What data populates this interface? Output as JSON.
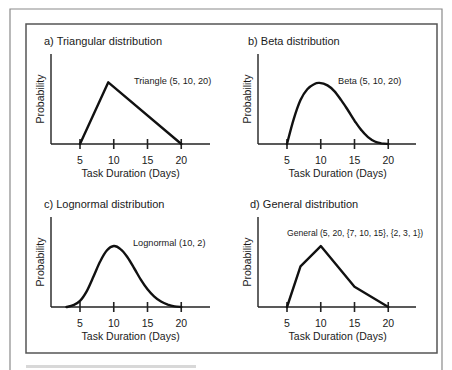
{
  "figure": {
    "caption": ""
  },
  "chart_data": [
    {
      "type": "line",
      "title": "a) Triangular distribution",
      "annotation": "Triangle (5, 10, 20)",
      "xlabel": "Task Duration (Days)",
      "ylabel": "Probability",
      "xticks": [
        5,
        10,
        15,
        20
      ],
      "xlim": [
        0,
        24
      ],
      "ylim": [
        0,
        1
      ],
      "grid": false,
      "series": [
        {
          "name": "Triangle (5, 10, 20)",
          "x": [
            5,
            9.2,
            20
          ],
          "y": [
            0,
            0.95,
            0
          ]
        }
      ]
    },
    {
      "type": "line",
      "title": "b) Beta distribution",
      "annotation": "Beta (5, 10, 20)",
      "xlabel": "Task Duration (Days)",
      "ylabel": "Probability",
      "xticks": [
        5,
        10,
        15,
        20
      ],
      "xlim": [
        0,
        24
      ],
      "ylim": [
        0,
        1
      ],
      "grid": false,
      "series": [
        {
          "name": "Beta (5, 10, 20)",
          "x": [
            5,
            6,
            7,
            8,
            9,
            9.8,
            11,
            12,
            13,
            14,
            15,
            16,
            17,
            18,
            19,
            20
          ],
          "y": [
            0,
            0.4,
            0.7,
            0.87,
            0.95,
            0.97,
            0.93,
            0.84,
            0.7,
            0.54,
            0.37,
            0.22,
            0.11,
            0.04,
            0.01,
            0
          ]
        }
      ]
    },
    {
      "type": "line",
      "title": "c) Lognormal distribution",
      "annotation": "Lognormal (10, 2)",
      "xlabel": "Task Duration (Days)",
      "ylabel": "Probability",
      "xticks": [
        5,
        10,
        15,
        20
      ],
      "xlim": [
        0,
        24
      ],
      "ylim": [
        0,
        1
      ],
      "grid": false,
      "series": [
        {
          "name": "Lognormal (10, 2)",
          "x": [
            3,
            4,
            5,
            6,
            7,
            8,
            9,
            10,
            11,
            12,
            13,
            14,
            15,
            16,
            17,
            18,
            19,
            20
          ],
          "y": [
            0,
            0.03,
            0.1,
            0.26,
            0.5,
            0.75,
            0.93,
            1.0,
            0.95,
            0.82,
            0.64,
            0.45,
            0.29,
            0.17,
            0.09,
            0.04,
            0.01,
            0
          ]
        }
      ]
    },
    {
      "type": "line",
      "title": "d) General distribution",
      "annotation": "General (5, 20, {7, 10, 15}, {2, 3, 1})",
      "xlabel": "Task Duration (Days)",
      "ylabel": "Probability",
      "xticks": [
        5,
        10,
        15,
        20
      ],
      "xlim": [
        0,
        24
      ],
      "ylim": [
        0,
        3.3
      ],
      "grid": false,
      "series": [
        {
          "name": "General (5, 20, {7, 10, 15}, {2, 3, 1})",
          "x": [
            5,
            7,
            10,
            15,
            20
          ],
          "y": [
            0,
            2,
            3,
            1,
            0
          ]
        }
      ]
    }
  ]
}
